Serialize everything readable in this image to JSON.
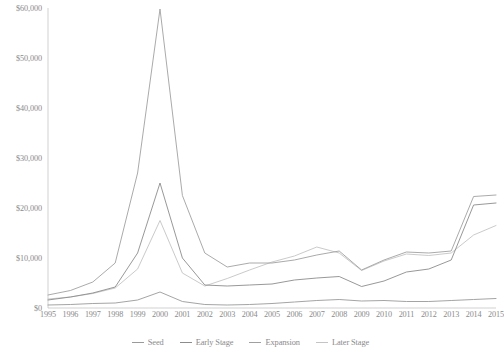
{
  "chart_data": {
    "type": "line",
    "title": "",
    "subtitle": "",
    "xlabel": "",
    "ylabel": "",
    "grid": false,
    "legend_position": "bottom",
    "x": [
      1995,
      1996,
      1997,
      1998,
      1999,
      2000,
      2001,
      2002,
      2003,
      2004,
      2005,
      2006,
      2007,
      2008,
      2009,
      2010,
      2011,
      2012,
      2013,
      2014,
      2015
    ],
    "categories": [
      "1995",
      "1996",
      "1997",
      "1998",
      "1999",
      "2000",
      "2001",
      "2002",
      "2003",
      "2004",
      "2005",
      "2006",
      "2007",
      "2008",
      "2009",
      "2010",
      "2011",
      "2012",
      "2013",
      "2014",
      "2015"
    ],
    "xlim": [
      1995,
      2015
    ],
    "ylim": [
      0,
      60000
    ],
    "y_ticks": [
      0,
      10000,
      20000,
      30000,
      40000,
      50000,
      60000
    ],
    "y_tick_labels": [
      "$0",
      "$10,000",
      "$20,000",
      "$30,000",
      "$40,000",
      "$50,000",
      "$60,000"
    ],
    "series": [
      {
        "name": "Seed",
        "color": "#9a9a9a",
        "values": [
          600,
          700,
          900,
          1000,
          1600,
          3200,
          1300,
          700,
          600,
          700,
          900,
          1200,
          1500,
          1700,
          1400,
          1500,
          1300,
          1300,
          1500,
          1700,
          1900
        ]
      },
      {
        "name": "Early Stage",
        "color": "#8c8c8c",
        "values": [
          1600,
          2200,
          3000,
          4200,
          11000,
          25000,
          10000,
          4600,
          4400,
          4600,
          4800,
          5600,
          6000,
          6300,
          4300,
          5400,
          7200,
          7800,
          9600,
          20600,
          21000
        ]
      },
      {
        "name": "Expansion",
        "color": "#a0a0a0",
        "values": [
          2600,
          3500,
          5200,
          9000,
          27000,
          59800,
          22500,
          11000,
          8200,
          9000,
          9000,
          9600,
          10600,
          11400,
          7600,
          9600,
          11200,
          11000,
          11400,
          22300,
          22600
        ]
      },
      {
        "name": "Later Stage",
        "color": "#c4c4c4",
        "values": [
          1800,
          2200,
          2900,
          4000,
          7800,
          17500,
          7000,
          4400,
          5900,
          7600,
          9200,
          10400,
          12200,
          11000,
          7500,
          9400,
          10800,
          10500,
          11000,
          14600,
          16500
        ]
      }
    ]
  },
  "legend": {
    "items": [
      {
        "label": "Seed",
        "color": "#9a9a9a"
      },
      {
        "label": "Early Stage",
        "color": "#8c8c8c"
      },
      {
        "label": "Expansion",
        "color": "#a0a0a0"
      },
      {
        "label": "Later Stage",
        "color": "#c4c4c4"
      }
    ]
  },
  "axes": {
    "baseline_color": "#bdbdbd"
  }
}
